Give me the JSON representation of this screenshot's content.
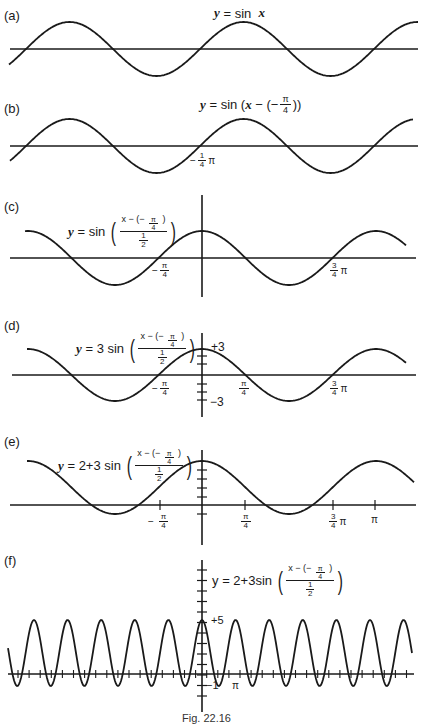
{
  "figure": {
    "caption": "Fig. 22.16",
    "panels": [
      {
        "id": "a",
        "label": "(a)",
        "equation": "y = sin  x"
      },
      {
        "id": "b",
        "label": "(b)",
        "equation": "y = sin (x − (− π/4))",
        "ticks": [
          "−1/4 π"
        ]
      },
      {
        "id": "c",
        "label": "(c)",
        "equation": "y = sin ((x − (− π/4)) / (1/2))",
        "ticks": [
          "−π/4",
          "3/4 π"
        ]
      },
      {
        "id": "d",
        "label": "(d)",
        "equation": "y = 3 sin ((x − (− π/4)) / (1/2))",
        "ticks": [
          "−π/4",
          "π/4",
          "3/4 π"
        ],
        "y_ticks": [
          "+3",
          "−3"
        ]
      },
      {
        "id": "e",
        "label": "(e)",
        "equation": "y = 2+3 sin ((x − (− π/4)) / (1/2))",
        "ticks": [
          "−π/4",
          "π/4",
          "3/4 π",
          "π"
        ]
      },
      {
        "id": "f",
        "label": "(f)",
        "equation": "y = 2+3sin ((x − (− π/4)) / (1/2))",
        "ticks": [
          "π"
        ],
        "y_ticks": [
          "+5",
          "−1"
        ]
      }
    ],
    "eq_parts": {
      "y": "y",
      "eq": "=",
      "sin": "sin",
      "x": "x",
      "sin_x_tail": "x",
      "b_inner": "x − (−",
      "b_close": "))",
      "pi": "π",
      "four": "4",
      "one": "1",
      "two": "2",
      "num": "x − (− ",
      "num_close": " )",
      "three": "3",
      "two_plus_three": "2+3",
      "two_plus_three_sin": "2+3sin"
    },
    "tick_labels": {
      "neg_quarter_pi_b": "− 1/4 π",
      "neg": "−",
      "pi": "π",
      "four": "4",
      "three": "3",
      "one": "1",
      "plus3": "+3",
      "minus3": "−3",
      "plus5": "+5",
      "minus1": "−1"
    }
  },
  "chart_data": [
    {
      "type": "line",
      "title": "(a) y = sin x",
      "series": [
        {
          "name": "y = sin x",
          "function": "sin(x)",
          "amplitude": 1,
          "period": "2π",
          "phase_shift": 0,
          "vertical_shift": 0
        }
      ],
      "xlabel": "",
      "ylabel": "",
      "grid": false
    },
    {
      "type": "line",
      "title": "(b) y = sin (x − (−π/4))",
      "series": [
        {
          "name": "y = sin(x + π/4)",
          "amplitude": 1,
          "period": "2π",
          "phase_shift": "−π/4",
          "vertical_shift": 0
        }
      ],
      "x_tick_labels": [
        "−1/4 π"
      ],
      "grid": false
    },
    {
      "type": "line",
      "title": "(c) y = sin ((x − (−π/4)) / (1/2))",
      "series": [
        {
          "name": "y = sin(2(x + π/4))",
          "amplitude": 1,
          "period": "π",
          "phase_shift": "−π/4",
          "vertical_shift": 0
        }
      ],
      "x_tick_labels": [
        "−π/4",
        "3/4 π"
      ],
      "grid": false
    },
    {
      "type": "line",
      "title": "(d) y = 3 sin ((x − (−π/4)) / (1/2))",
      "series": [
        {
          "name": "y = 3 sin(2(x + π/4))",
          "amplitude": 3,
          "period": "π",
          "phase_shift": "−π/4",
          "vertical_shift": 0
        }
      ],
      "x_tick_labels": [
        "−π/4",
        "π/4",
        "3/4 π"
      ],
      "y_tick_labels": [
        "+3",
        "−3"
      ],
      "ylim": [
        -3,
        3
      ],
      "grid": false
    },
    {
      "type": "line",
      "title": "(e) y = 2+3 sin ((x − (−π/4)) / (1/2))",
      "series": [
        {
          "name": "y = 2 + 3 sin(2(x + π/4))",
          "amplitude": 3,
          "period": "π",
          "phase_shift": "−π/4",
          "vertical_shift": 2
        }
      ],
      "x_tick_labels": [
        "−π/4",
        "π/4",
        "3/4 π",
        "π"
      ],
      "ylim": [
        -1,
        5
      ],
      "grid": false
    },
    {
      "type": "line",
      "title": "(f) y = 2+3sin ((x − (−π/4)) / (1/2))",
      "series": [
        {
          "name": "y = 2 + 3 sin(2(x + π/4)) (zoomed out)",
          "amplitude": 3,
          "period": "π",
          "phase_shift": "−π/4",
          "vertical_shift": 2,
          "max": 5,
          "min": -1
        }
      ],
      "x_tick_labels": [
        "π"
      ],
      "y_tick_labels": [
        "+5",
        "−1"
      ],
      "ylim": [
        -1,
        5
      ],
      "grid": false
    }
  ]
}
